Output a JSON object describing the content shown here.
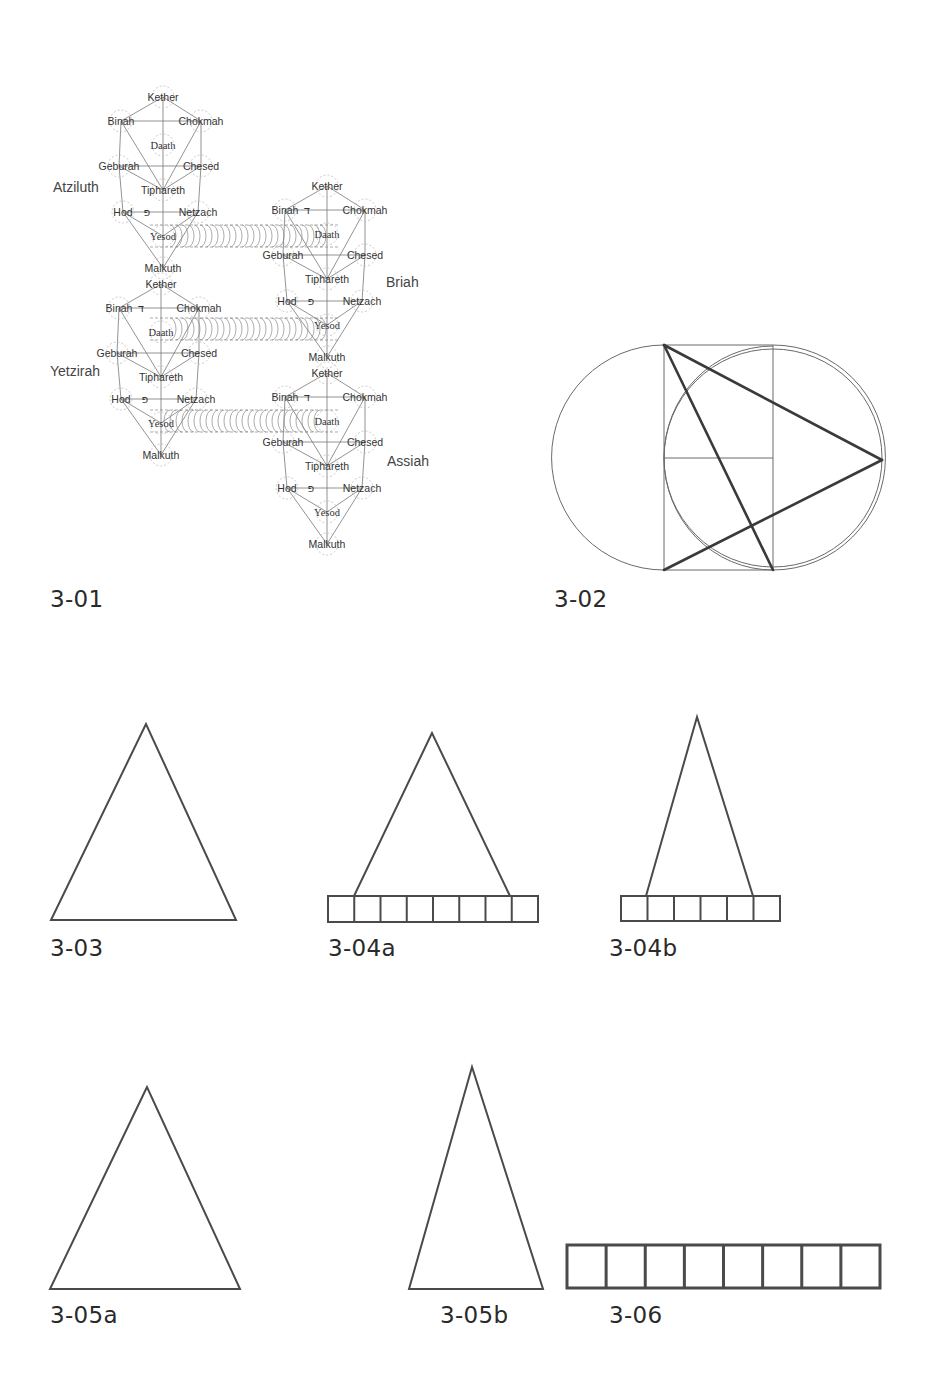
{
  "figures": [
    {
      "id": "3-01",
      "caption": "3-01",
      "type": "tree-of-life-four-worlds"
    },
    {
      "id": "3-02",
      "caption": "3-02",
      "type": "circles-square-triangle-construction"
    },
    {
      "id": "3-03",
      "caption": "3-03",
      "type": "triangle"
    },
    {
      "id": "3-04a",
      "caption": "3-04a",
      "type": "triangle-on-8-cell-bar"
    },
    {
      "id": "3-04b",
      "caption": "3-04b",
      "type": "triangle-on-6-cell-bar"
    },
    {
      "id": "3-05a",
      "caption": "3-05a",
      "type": "triangle"
    },
    {
      "id": "3-05b",
      "caption": "3-05b",
      "type": "narrow-triangle"
    },
    {
      "id": "3-06",
      "caption": "3-06",
      "type": "8-cell-bar"
    }
  ],
  "tree": {
    "worlds": [
      "Atziluth",
      "Briah",
      "Yetzirah",
      "Assiah"
    ],
    "sephiroth": [
      "Kether",
      "Binah",
      "Chokmah",
      "Daath",
      "Geburah",
      "Chesed",
      "Tiphareth",
      "Hod",
      "Netzach",
      "Yesod",
      "Malkuth"
    ],
    "hebrew_letters": {
      "daleth": "ד",
      "peh": "פ"
    }
  },
  "colors": {
    "line": "#555555",
    "thick_line": "#333333",
    "text": "#2a2a2a"
  }
}
